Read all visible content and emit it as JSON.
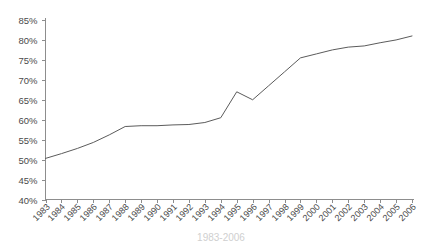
{
  "chart_data": {
    "type": "line",
    "title": "",
    "subtitle": "",
    "xlabel": "",
    "ylabel": "",
    "grid": false,
    "legend": null,
    "legend_position": "none",
    "ylim": [
      40,
      85
    ],
    "ytick_labels": [
      "85%",
      "80%",
      "75%",
      "70%",
      "65%",
      "60%",
      "55%",
      "50%",
      "45%",
      "40%"
    ],
    "ytick_values": [
      85,
      80,
      75,
      70,
      65,
      60,
      55,
      50,
      45,
      40
    ],
    "categories": [
      "1983",
      "1984",
      "1985",
      "1986",
      "1987",
      "1988",
      "1989",
      "1990",
      "1991",
      "1992",
      "1993",
      "1994",
      "1995",
      "1996",
      "1997",
      "1998",
      "1999",
      "2000",
      "2001",
      "2002",
      "2003",
      "2004",
      "2005",
      "2006"
    ],
    "values": [
      50.3,
      51.5,
      52.8,
      54.3,
      56.2,
      58.3,
      58.5,
      58.5,
      58.7,
      58.8,
      59.3,
      60.5,
      67.0,
      65.0,
      68.5,
      72.0,
      75.5,
      76.5,
      77.5,
      78.2,
      78.5,
      79.3,
      80.0,
      81.0
    ],
    "series": [
      {
        "name": "series-1",
        "color": "#5b5b5b",
        "values": [
          50.3,
          51.5,
          52.8,
          54.3,
          56.2,
          58.3,
          58.5,
          58.5,
          58.7,
          58.8,
          59.3,
          60.5,
          67.0,
          65.0,
          68.5,
          72.0,
          75.5,
          76.5,
          77.5,
          78.2,
          78.5,
          79.3,
          80.0,
          81.0
        ]
      }
    ],
    "annotations": []
  },
  "axes": {
    "y_axis_name": "percent-axis",
    "x_axis_name": "year-axis"
  },
  "caption": {
    "text": "1983-2006"
  },
  "colors": {
    "line": "#5b5b5b",
    "axis": "#8d8d8d",
    "text": "#4a4a4a",
    "background": "#ffffff"
  }
}
